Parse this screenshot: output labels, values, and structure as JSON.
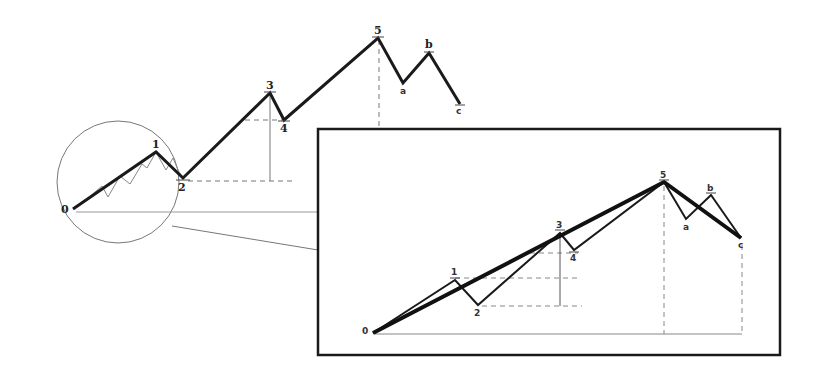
{
  "diagram": {
    "main_wave": {
      "points": [
        {
          "label": "0",
          "x": 73,
          "y": 209
        },
        {
          "label": "1",
          "x": 156,
          "y": 152
        },
        {
          "label": "2",
          "x": 183,
          "y": 178
        },
        {
          "label": "3",
          "x": 270,
          "y": 93
        },
        {
          "label": "4",
          "x": 284,
          "y": 120
        },
        {
          "label": "5",
          "x": 378,
          "y": 38
        },
        {
          "label": "a",
          "x": 403,
          "y": 83
        },
        {
          "label": "b",
          "x": 429,
          "y": 53
        },
        {
          "label": "c",
          "x": 460,
          "y": 104
        }
      ]
    },
    "zoom_circle": {
      "cx": 118,
      "cy": 182,
      "r": 60
    },
    "inset": {
      "box": {
        "x": 318,
        "y": 129,
        "w": 462,
        "h": 226
      },
      "points": [
        {
          "label": "0",
          "x": 373,
          "y": 333
        },
        {
          "label": "1",
          "x": 455,
          "y": 280
        },
        {
          "label": "2",
          "x": 478,
          "y": 305
        },
        {
          "label": "3",
          "x": 560,
          "y": 233
        },
        {
          "label": "4",
          "x": 574,
          "y": 250
        },
        {
          "label": "5",
          "x": 664,
          "y": 182
        },
        {
          "label": "a",
          "x": 686,
          "y": 219
        },
        {
          "label": "b",
          "x": 711,
          "y": 195
        },
        {
          "label": "c",
          "x": 741,
          "y": 238
        }
      ]
    },
    "labels": {
      "p0": "0",
      "p1": "1",
      "p2": "2",
      "p3": "3",
      "p4": "4",
      "p5": "5",
      "pa": "a",
      "pb": "b",
      "pc": "c"
    }
  }
}
